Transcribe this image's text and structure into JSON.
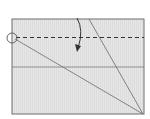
{
  "diagram": {
    "type": "origami-fold-step",
    "paper": {
      "x": 12,
      "y": 19,
      "width": 132,
      "height": 95,
      "fill": "#e3e3e3",
      "stroke": "#6e6e6e"
    },
    "valley_fold_line": {
      "y": 37,
      "style": "dashed",
      "color": "#333333"
    },
    "crease_horizontal": {
      "y": 67,
      "color": "#7a7a7a"
    },
    "crease_diagonal_1": {
      "x1": 15,
      "y1": 39,
      "x2": 143,
      "y2": 114,
      "color": "#6a6a6a"
    },
    "crease_diagonal_2": {
      "x1": 89,
      "y1": 19,
      "x2": 143,
      "y2": 114,
      "color": "#6a6a6a"
    },
    "reference_circle": {
      "cx": 12,
      "cy": 38,
      "r": 5,
      "color": "#555555"
    },
    "fold_arrow": {
      "direction": "down",
      "color": "#333333"
    }
  }
}
